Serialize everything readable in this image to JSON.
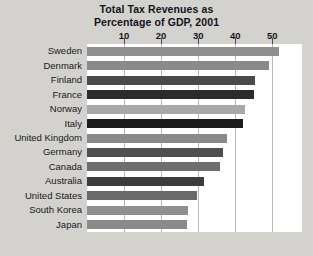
{
  "chart_data": {
    "type": "bar",
    "orientation": "horizontal",
    "title": "Total Tax Revenues as Percentage of GDP, 2001",
    "title_lines": [
      "Total Tax Revenues as",
      "Percentage of GDP, 2001"
    ],
    "xlabel": "",
    "ylabel": "",
    "xlim": [
      0,
      58
    ],
    "xticks": [
      10,
      20,
      30,
      40,
      50
    ],
    "xtick_labels": [
      "10",
      "20",
      "30",
      "40",
      "50"
    ],
    "grid": true,
    "legend": "none",
    "categories": [
      "Sweden",
      "Denmark",
      "Finland",
      "France",
      "Norway",
      "Italy",
      "United Kingdom",
      "Germany",
      "Canada",
      "Australia",
      "United States",
      "South Korea",
      "Japan"
    ],
    "values": [
      51.7,
      49.2,
      45.4,
      45.1,
      42.5,
      42.0,
      37.9,
      36.8,
      35.9,
      31.5,
      29.6,
      27.2,
      27.1
    ],
    "bar_colors": [
      "#8f8f8f",
      "#8a8a8a",
      "#4a4a4a",
      "#2b2b2b",
      "#a8a8a8",
      "#1c1c1c",
      "#8a8a8a",
      "#4f4f4f",
      "#6e6e6e",
      "#3c3c3c",
      "#696969",
      "#8f8f8f",
      "#8a8a8a"
    ]
  },
  "figure": {
    "background_color": "#d3d2cf",
    "plot_background_color": "#ffffff",
    "gridline_color": "#b9b8b6",
    "text_color": "#15151c"
  }
}
